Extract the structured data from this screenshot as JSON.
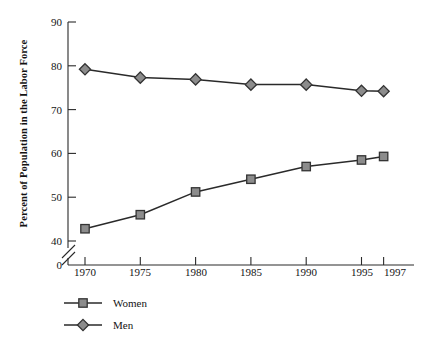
{
  "chart_data": {
    "type": "line",
    "title": "",
    "xlabel": "",
    "ylabel": "Percent of Population in the Labor Force",
    "categories": [
      "1970",
      "1975",
      "1980",
      "1985",
      "1990",
      "1995",
      "1997"
    ],
    "x": [
      1970,
      1975,
      1980,
      1985,
      1990,
      1995,
      1997
    ],
    "series": [
      {
        "name": "Women",
        "marker": "square",
        "values": [
          42.8,
          46.0,
          51.2,
          54.1,
          57.0,
          58.5,
          59.3
        ]
      },
      {
        "name": "Men",
        "marker": "diamond",
        "values": [
          79.2,
          77.3,
          76.9,
          75.7,
          75.7,
          74.3,
          74.2
        ]
      }
    ],
    "ylim": [
      40,
      90
    ],
    "yticks": [
      40,
      50,
      60,
      70,
      80,
      90
    ],
    "ytick_labels": [
      "40",
      "50",
      "60",
      "70",
      "80",
      "90"
    ],
    "y_axis_break": true,
    "y_origin_label": "0",
    "xtick_labels": [
      "1970",
      "1975",
      "1980",
      "1985",
      "1990",
      "1995",
      "1997"
    ],
    "grid": false,
    "legend_position": "below-left",
    "colors": {
      "line": "#2a2a2a",
      "marker_fill": "#8c8c8c",
      "marker_stroke": "#333333",
      "axis": "#2a2a2a",
      "text": "#141414",
      "background": "#ffffff"
    }
  },
  "legend": {
    "items": [
      {
        "label": "Women"
      },
      {
        "label": "Men"
      }
    ]
  },
  "axes": {
    "y_title": "Percent of Population in the Labor Force",
    "y_ticks": [
      "90",
      "80",
      "70",
      "60",
      "50",
      "40",
      "0"
    ],
    "x_ticks": [
      "1970",
      "1975",
      "1980",
      "1985",
      "1990",
      "1995",
      "1997"
    ]
  }
}
